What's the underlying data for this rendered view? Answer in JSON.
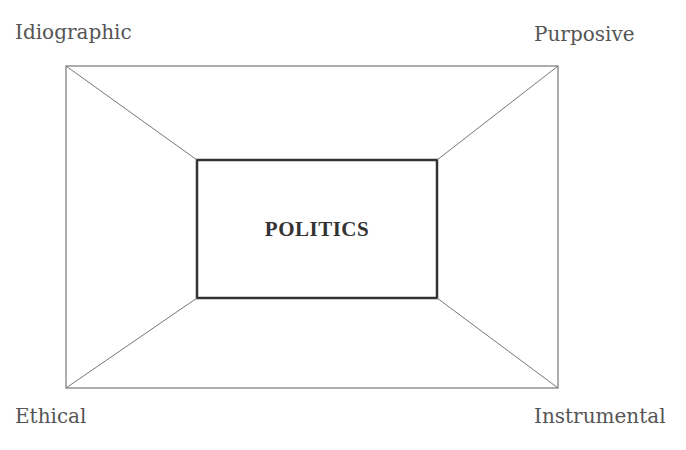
{
  "diagram": {
    "center_label": "POLITICS",
    "corners": {
      "top_left": "Idiographic",
      "top_right": "Purposive",
      "bottom_left": "Ethical",
      "bottom_right": "Instrumental"
    },
    "colors": {
      "outer_line": "#777777",
      "inner_line": "#333333",
      "text": "#555555"
    }
  }
}
